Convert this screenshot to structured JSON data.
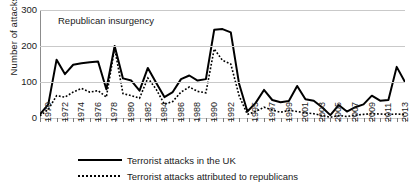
{
  "chart_data": {
    "type": "line",
    "title": "",
    "xlabel": "",
    "ylabel": "Number of attacks",
    "ylim": [
      0,
      300
    ],
    "yticks": [
      0,
      100,
      200,
      300
    ],
    "grid": true,
    "legend_position": "bottom",
    "annotations": [
      {
        "text": "Republican insurgency",
        "x": 1972,
        "y": 268
      }
    ],
    "x": [
      1970,
      1971,
      1972,
      1973,
      1974,
      1975,
      1976,
      1977,
      1978,
      1979,
      1980,
      1981,
      1982,
      1983,
      1984,
      1985,
      1986,
      1987,
      1988,
      1989,
      1990,
      1991,
      1992,
      1993,
      1994,
      1995,
      1996,
      1997,
      1998,
      1999,
      2000,
      2001,
      2002,
      2003,
      2004,
      2005,
      2006,
      2007,
      2008,
      2009,
      2010,
      2011,
      2012,
      2013,
      2014
    ],
    "xtick_labels": [
      "1970",
      "1972",
      "1974",
      "1976",
      "1978",
      "1980",
      "1982",
      "1984",
      "1986",
      "1988",
      "1990",
      "1992",
      "1995",
      "1997",
      "1999",
      "2001",
      "2003",
      "2005",
      "2007",
      "2009",
      "2011",
      "2013"
    ],
    "xtick_values": [
      1970,
      1972,
      1974,
      1976,
      1978,
      1980,
      1982,
      1984,
      1986,
      1988,
      1990,
      1992,
      1995,
      1997,
      1999,
      2001,
      2003,
      2005,
      2007,
      2009,
      2011,
      2013
    ],
    "series": [
      {
        "name": "Terrorist attacks in the UK",
        "style": "solid",
        "color": "#000000",
        "values": [
          10,
          38,
          162,
          122,
          148,
          152,
          155,
          157,
          80,
          200,
          110,
          104,
          76,
          139,
          98,
          58,
          72,
          108,
          118,
          104,
          108,
          245,
          247,
          238,
          95,
          18,
          42,
          78,
          50,
          44,
          47,
          89,
          52,
          48,
          30,
          8,
          36,
          18,
          30,
          38,
          62,
          48,
          50,
          142,
          100
        ]
      },
      {
        "name": "Terrorist attacks attributed to republicans",
        "style": "dotted",
        "color": "#000000",
        "values": [
          6,
          24,
          62,
          58,
          72,
          82,
          72,
          76,
          58,
          194,
          68,
          62,
          55,
          111,
          80,
          38,
          46,
          72,
          86,
          74,
          70,
          192,
          160,
          150,
          62,
          10,
          18,
          30,
          22,
          16,
          21,
          18,
          14,
          12,
          7,
          2,
          7,
          4,
          8,
          10,
          12,
          11,
          10,
          11,
          10
        ]
      }
    ]
  },
  "legend": {
    "items": [
      {
        "label": "Terrorist attacks in the UK",
        "style": "solid"
      },
      {
        "label": "Terrorist attacks attributed to republicans",
        "style": "dotted"
      }
    ]
  }
}
